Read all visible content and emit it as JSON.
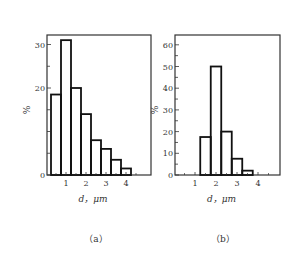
{
  "chart_data": [
    {
      "type": "bar",
      "panel": "(a)",
      "xlabel": "d，μm",
      "ylabel": "%",
      "x_ticks": [
        "1",
        "2",
        "3",
        "4"
      ],
      "y_ticks": [
        "0",
        "20",
        "30"
      ],
      "ylim": [
        0,
        32
      ],
      "xlim": [
        0,
        5.2
      ],
      "grid": false,
      "bins": [
        [
          0.25,
          0.75
        ],
        [
          0.75,
          1.25
        ],
        [
          1.25,
          1.75
        ],
        [
          1.75,
          2.25
        ],
        [
          2.25,
          2.75
        ],
        [
          2.75,
          3.25
        ],
        [
          3.25,
          3.75
        ],
        [
          3.75,
          4.25
        ]
      ],
      "categories": [
        "0.5",
        "1.0",
        "1.5",
        "2.0",
        "2.5",
        "3.0",
        "3.5",
        "4.0"
      ],
      "values": [
        18.5,
        31,
        20,
        14,
        8,
        6,
        3.5,
        1.5
      ]
    },
    {
      "type": "bar",
      "panel": "(b)",
      "xlabel": "d，μm",
      "ylabel": "%",
      "x_ticks": [
        "1",
        "2",
        "3",
        "4"
      ],
      "y_ticks": [
        "0",
        "10",
        "20",
        "30",
        "40",
        "50",
        "60"
      ],
      "ylim": [
        0,
        65
      ],
      "xlim": [
        0,
        5
      ],
      "grid": false,
      "bins": [
        [
          1.25,
          1.75
        ],
        [
          1.75,
          2.25
        ],
        [
          2.25,
          2.75
        ],
        [
          2.75,
          3.25
        ],
        [
          3.25,
          3.75
        ]
      ],
      "categories": [
        "1.5",
        "2.0",
        "2.5",
        "3.0",
        "3.5"
      ],
      "values": [
        17.5,
        50,
        20,
        7.5,
        2
      ]
    }
  ],
  "captions": {
    "a": "（a）",
    "b": "（b）"
  },
  "labels": {
    "xlabel_a": "d，μm",
    "xlabel_b": "d，μm",
    "ylabel_a": "%",
    "ylabel_b": "%"
  }
}
